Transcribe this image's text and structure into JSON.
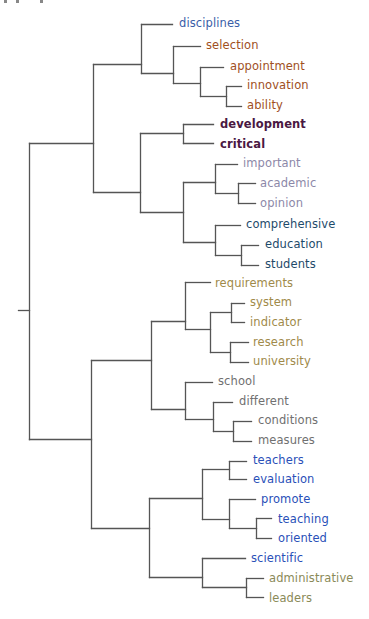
{
  "figure": {
    "type": "dendrogram",
    "orientation": "left-to-right",
    "line_color": "#555555"
  },
  "clusters": {
    "A": {
      "color": "#3a5ea8",
      "leaves": [
        "disciplines"
      ]
    },
    "B": {
      "color": "#a0501e",
      "leaves": [
        "selection",
        "appointment",
        "innovation",
        "ability"
      ]
    },
    "C": {
      "color": "#4a1842",
      "leaves": [
        "development",
        "critical"
      ]
    },
    "D": {
      "color": "#8c88a8",
      "leaves": [
        "important",
        "academic",
        "opinion"
      ]
    },
    "E": {
      "color": "#1e4a6a",
      "leaves": [
        "comprehensive",
        "education",
        "students"
      ]
    },
    "F": {
      "color": "#a08a4a",
      "leaves": [
        "requirements",
        "system",
        "indicator",
        "research",
        "university"
      ]
    },
    "G": {
      "color": "#707070",
      "leaves": [
        "school",
        "different",
        "conditions",
        "measures"
      ]
    },
    "H": {
      "color": "#2a50b8",
      "leaves": [
        "teachers",
        "evaluation",
        "promote",
        "teaching",
        "oriented",
        "scientific"
      ]
    },
    "I": {
      "color": "#8a8a58",
      "leaves": [
        "administrative",
        "leaders"
      ]
    }
  },
  "leaves": [
    {
      "label": "disciplines",
      "x": 179,
      "y": 24,
      "color": "#3a5ea8",
      "weight": "normal"
    },
    {
      "label": "selection",
      "x": 206,
      "y": 46,
      "color": "#a0501e",
      "weight": "normal"
    },
    {
      "label": "appointment",
      "x": 230,
      "y": 67,
      "color": "#a0501e",
      "weight": "normal"
    },
    {
      "label": "innovation",
      "x": 247,
      "y": 86,
      "color": "#a0501e",
      "weight": "normal"
    },
    {
      "label": "ability",
      "x": 247,
      "y": 106,
      "color": "#a0501e",
      "weight": "normal"
    },
    {
      "label": "development",
      "x": 220,
      "y": 125,
      "color": "#4a1842",
      "weight": "bold"
    },
    {
      "label": "critical",
      "x": 220,
      "y": 145,
      "color": "#4a1842",
      "weight": "bold"
    },
    {
      "label": "important",
      "x": 243,
      "y": 164,
      "color": "#8c88a8",
      "weight": "normal"
    },
    {
      "label": "academic",
      "x": 260,
      "y": 184,
      "color": "#8c88a8",
      "weight": "normal"
    },
    {
      "label": "opinion",
      "x": 260,
      "y": 204,
      "color": "#8c88a8",
      "weight": "normal"
    },
    {
      "label": "comprehensive",
      "x": 246,
      "y": 225,
      "color": "#1e4a6a",
      "weight": "normal"
    },
    {
      "label": "education",
      "x": 265,
      "y": 245,
      "color": "#1e4a6a",
      "weight": "normal"
    },
    {
      "label": "students",
      "x": 265,
      "y": 265,
      "color": "#1e4a6a",
      "weight": "normal"
    },
    {
      "label": "requirements",
      "x": 215,
      "y": 284,
      "color": "#a08a4a",
      "weight": "normal"
    },
    {
      "label": "system",
      "x": 250,
      "y": 303,
      "color": "#a08a4a",
      "weight": "normal"
    },
    {
      "label": "indicator",
      "x": 250,
      "y": 323,
      "color": "#a08a4a",
      "weight": "normal"
    },
    {
      "label": "research",
      "x": 253,
      "y": 343,
      "color": "#a08a4a",
      "weight": "normal"
    },
    {
      "label": "university",
      "x": 253,
      "y": 362,
      "color": "#a08a4a",
      "weight": "normal"
    },
    {
      "label": "school",
      "x": 218,
      "y": 382,
      "color": "#707070",
      "weight": "normal"
    },
    {
      "label": "different",
      "x": 239,
      "y": 402,
      "color": "#707070",
      "weight": "normal"
    },
    {
      "label": "conditions",
      "x": 258,
      "y": 421,
      "color": "#707070",
      "weight": "normal"
    },
    {
      "label": "measures",
      "x": 258,
      "y": 441,
      "color": "#707070",
      "weight": "normal"
    },
    {
      "label": "teachers",
      "x": 253,
      "y": 461,
      "color": "#2a50b8",
      "weight": "normal"
    },
    {
      "label": "evaluation",
      "x": 253,
      "y": 480,
      "color": "#2a50b8",
      "weight": "normal"
    },
    {
      "label": "promote",
      "x": 261,
      "y": 500,
      "color": "#2a50b8",
      "weight": "normal"
    },
    {
      "label": "teaching",
      "x": 278,
      "y": 520,
      "color": "#2a50b8",
      "weight": "normal"
    },
    {
      "label": "oriented",
      "x": 278,
      "y": 539,
      "color": "#2a50b8",
      "weight": "normal"
    },
    {
      "label": "scientific",
      "x": 251,
      "y": 559,
      "color": "#2a50b8",
      "weight": "normal"
    },
    {
      "label": "administrative",
      "x": 269,
      "y": 579,
      "color": "#8a8a58",
      "weight": "normal"
    },
    {
      "label": "leaders",
      "x": 269,
      "y": 599,
      "color": "#8a8a58",
      "weight": "normal"
    }
  ],
  "links": [
    [
      18,
      310,
      29,
      310
    ],
    [
      29,
      143,
      29,
      439
    ],
    [
      29,
      143,
      93,
      143
    ],
    [
      29,
      439,
      91,
      439
    ],
    [
      93,
      64,
      93,
      192
    ],
    [
      93,
      64,
      141,
      64
    ],
    [
      93,
      192,
      140,
      192
    ],
    [
      141,
      24,
      141,
      73
    ],
    [
      141,
      24,
      172,
      24
    ],
    [
      141,
      73,
      173,
      73
    ],
    [
      173,
      46,
      173,
      83
    ],
    [
      173,
      46,
      200,
      46
    ],
    [
      173,
      83,
      200,
      83
    ],
    [
      200,
      67,
      200,
      96
    ],
    [
      200,
      67,
      223,
      67
    ],
    [
      200,
      96,
      226,
      96
    ],
    [
      226,
      86,
      226,
      106
    ],
    [
      226,
      86,
      241,
      86
    ],
    [
      226,
      106,
      241,
      106
    ],
    [
      140,
      133,
      140,
      212
    ],
    [
      140,
      133,
      183,
      133
    ],
    [
      140,
      212,
      183,
      212
    ],
    [
      183,
      124,
      183,
      143
    ],
    [
      183,
      124,
      213,
      124
    ],
    [
      183,
      143,
      213,
      143
    ],
    [
      183,
      182,
      183,
      242
    ],
    [
      183,
      182,
      215,
      182
    ],
    [
      183,
      242,
      215,
      242
    ],
    [
      215,
      164,
      215,
      193
    ],
    [
      215,
      164,
      237,
      164
    ],
    [
      215,
      193,
      238,
      193
    ],
    [
      238,
      183,
      238,
      203
    ],
    [
      238,
      183,
      255,
      183
    ],
    [
      238,
      203,
      255,
      203
    ],
    [
      215,
      225,
      215,
      255
    ],
    [
      215,
      225,
      240,
      225
    ],
    [
      215,
      255,
      241,
      255
    ],
    [
      241,
      245,
      241,
      265
    ],
    [
      241,
      245,
      258,
      245
    ],
    [
      241,
      265,
      258,
      265
    ],
    [
      91,
      360,
      91,
      528
    ],
    [
      91,
      360,
      151,
      360
    ],
    [
      91,
      528,
      149,
      528
    ],
    [
      151,
      321,
      151,
      409
    ],
    [
      151,
      321,
      185,
      321
    ],
    [
      151,
      409,
      185,
      409
    ],
    [
      185,
      282,
      185,
      329
    ],
    [
      185,
      282,
      210,
      282
    ],
    [
      185,
      329,
      210,
      329
    ],
    [
      210,
      312,
      210,
      352
    ],
    [
      210,
      312,
      231,
      312
    ],
    [
      210,
      352,
      230,
      352
    ],
    [
      231,
      303,
      231,
      322
    ],
    [
      231,
      303,
      244,
      303
    ],
    [
      231,
      322,
      244,
      322
    ],
    [
      230,
      342,
      230,
      362
    ],
    [
      230,
      342,
      248,
      342
    ],
    [
      230,
      362,
      248,
      362
    ],
    [
      185,
      382,
      185,
      419
    ],
    [
      185,
      382,
      212,
      382
    ],
    [
      185,
      419,
      213,
      419
    ],
    [
      213,
      402,
      213,
      431
    ],
    [
      213,
      402,
      232,
      402
    ],
    [
      213,
      431,
      233,
      431
    ],
    [
      233,
      421,
      233,
      441
    ],
    [
      233,
      421,
      251,
      421
    ],
    [
      233,
      441,
      251,
      441
    ],
    [
      149,
      498,
      149,
      577
    ],
    [
      149,
      498,
      202,
      498
    ],
    [
      149,
      577,
      202,
      577
    ],
    [
      202,
      469,
      202,
      519
    ],
    [
      202,
      469,
      229,
      469
    ],
    [
      202,
      519,
      229,
      519
    ],
    [
      229,
      461,
      229,
      479
    ],
    [
      229,
      461,
      246,
      461
    ],
    [
      229,
      479,
      246,
      479
    ],
    [
      229,
      499,
      229,
      528
    ],
    [
      229,
      499,
      255,
      499
    ],
    [
      229,
      528,
      256,
      528
    ],
    [
      256,
      518,
      256,
      538
    ],
    [
      256,
      518,
      271,
      518
    ],
    [
      256,
      538,
      271,
      538
    ],
    [
      202,
      558,
      202,
      587
    ],
    [
      202,
      558,
      245,
      558
    ],
    [
      202,
      587,
      246,
      587
    ],
    [
      246,
      578,
      246,
      597
    ],
    [
      246,
      578,
      263,
      578
    ],
    [
      246,
      597,
      263,
      597
    ]
  ]
}
